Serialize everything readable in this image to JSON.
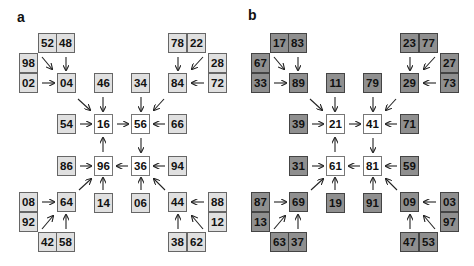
{
  "colors": {
    "panel_a_shade": "#e0e0e0",
    "panel_b_shade": "#8f8f8f",
    "center_box": "#ffffff",
    "arrow": "#222222"
  },
  "panels": [
    {
      "label": "a",
      "nodes": {
        "tl_top_left": "52",
        "tl_top_right": "48",
        "tl_side_top": "98",
        "tl_side_bottom": "02",
        "tl_hub": "04",
        "tr_top_left": "78",
        "tr_top_right": "22",
        "tr_side_top": "28",
        "tr_side_bottom": "72",
        "tr_hub": "84",
        "top_mid_left": "46",
        "top_mid_right": "34",
        "left_upper": "54",
        "right_upper": "66",
        "center_tl": "16",
        "center_tr": "56",
        "center_bl": "96",
        "center_br": "36",
        "left_lower": "86",
        "right_lower": "94",
        "bottom_mid_left": "14",
        "bottom_mid_right": "06",
        "bl_hub": "64",
        "bl_side_top": "08",
        "bl_side_bottom": "92",
        "bl_bottom_left": "42",
        "bl_bottom_right": "58",
        "br_hub": "44",
        "br_side_top": "88",
        "br_side_bottom": "12",
        "br_bottom_left": "38",
        "br_bottom_right": "62"
      }
    },
    {
      "label": "b",
      "nodes": {
        "tl_top_left": "17",
        "tl_top_right": "83",
        "tl_side_top": "67",
        "tl_side_bottom": "33",
        "tl_hub": "89",
        "tr_top_left": "23",
        "tr_top_right": "77",
        "tr_side_top": "27",
        "tr_side_bottom": "73",
        "tr_hub": "29",
        "top_mid_left": "11",
        "top_mid_right": "79",
        "left_upper": "39",
        "right_upper": "71",
        "center_tl": "21",
        "center_tr": "41",
        "center_bl": "61",
        "center_br": "81",
        "left_lower": "31",
        "right_lower": "59",
        "bottom_mid_left": "19",
        "bottom_mid_right": "91",
        "bl_hub": "69",
        "bl_side_top": "87",
        "bl_side_bottom": "13",
        "bl_bottom_left": "63",
        "bl_bottom_right": "37",
        "br_hub": "09",
        "br_side_top": "03",
        "br_side_bottom": "97",
        "br_bottom_left": "47",
        "br_bottom_right": "53"
      }
    }
  ]
}
